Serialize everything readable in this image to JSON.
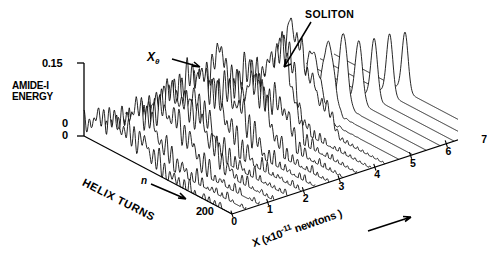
{
  "figure": {
    "type": "waterfall-3d-line-plot",
    "background": "#ffffff",
    "ink_color": "#000000"
  },
  "labels": {
    "y_axis_title_line1": "AMIDE-I",
    "y_axis_title_line2": "ENERGY",
    "y_max_tick": "0.15",
    "y_min_tick": "0",
    "origin_tick": "0",
    "depth_axis_title": "HELIX TURNS",
    "depth_arrow_symbol": "n",
    "depth_max_tick": "200",
    "x_axis_title_prefix": "X (x10",
    "x_axis_title_exponent": "-11",
    "x_axis_title_suffix": " newtons )",
    "annotation_soliton": "SOLITON",
    "annotation_xtheta_base": "X",
    "annotation_xtheta_sub": "θ"
  },
  "chart_data": {
    "type": "line",
    "title": "",
    "xlabel": "X (x10^-11 newtons)",
    "ylabel": "AMIDE-I ENERGY",
    "zlabel": "HELIX TURNS",
    "xlim": [
      0,
      7
    ],
    "ylim": [
      0,
      0.15
    ],
    "zlim": [
      0,
      200
    ],
    "grid": false,
    "legend": null,
    "x_ticks": [
      "0",
      "1",
      "2",
      "3",
      "4",
      "5",
      "6",
      "7"
    ],
    "x_tick_values": [
      0,
      1,
      2,
      3,
      4,
      5,
      6,
      7
    ],
    "y_ticks": [
      "0",
      "0.15"
    ],
    "y_tick_values": [
      0,
      0.15
    ],
    "z_ticks": [
      "0",
      "200"
    ],
    "z_tick_values": [
      0,
      200
    ],
    "n_traces": 19,
    "trace_axis": "X (force)",
    "series": [
      {
        "name": "X=0.00",
        "x_value": 0.0,
        "peak_height": 0.03,
        "peak_pos": 0.3,
        "peak_width": 0.26,
        "noise": 0.055,
        "ripple": 0.02,
        "sharp": false
      },
      {
        "name": "X=0.39",
        "x_value": 0.39,
        "peak_height": 0.034,
        "peak_pos": 0.31,
        "peak_width": 0.25,
        "noise": 0.055,
        "ripple": 0.021,
        "sharp": false
      },
      {
        "name": "X=0.78",
        "x_value": 0.78,
        "peak_height": 0.038,
        "peak_pos": 0.32,
        "peak_width": 0.24,
        "noise": 0.056,
        "ripple": 0.022,
        "sharp": false
      },
      {
        "name": "X=1.17",
        "x_value": 1.17,
        "peak_height": 0.043,
        "peak_pos": 0.33,
        "peak_width": 0.23,
        "noise": 0.057,
        "ripple": 0.023,
        "sharp": false
      },
      {
        "name": "X=1.56",
        "x_value": 1.56,
        "peak_height": 0.048,
        "peak_pos": 0.34,
        "peak_width": 0.22,
        "noise": 0.058,
        "ripple": 0.024,
        "sharp": false
      },
      {
        "name": "X=1.95",
        "x_value": 1.95,
        "peak_height": 0.054,
        "peak_pos": 0.35,
        "peak_width": 0.21,
        "noise": 0.058,
        "ripple": 0.025,
        "sharp": false
      },
      {
        "name": "X=2.33",
        "x_value": 2.33,
        "peak_height": 0.061,
        "peak_pos": 0.36,
        "peak_width": 0.195,
        "noise": 0.057,
        "ripple": 0.026,
        "sharp": false
      },
      {
        "name": "X=2.72",
        "x_value": 2.72,
        "peak_height": 0.069,
        "peak_pos": 0.37,
        "peak_width": 0.18,
        "noise": 0.055,
        "ripple": 0.026,
        "sharp": false
      },
      {
        "name": "X=3.11",
        "x_value": 3.11,
        "peak_height": 0.078,
        "peak_pos": 0.38,
        "peak_width": 0.16,
        "noise": 0.05,
        "ripple": 0.025,
        "sharp": false
      },
      {
        "name": "X=3.50",
        "x_value": 3.5,
        "peak_height": 0.088,
        "peak_pos": 0.39,
        "peak_width": 0.14,
        "noise": 0.044,
        "ripple": 0.023,
        "sharp": false
      },
      {
        "name": "X=3.89",
        "x_value": 3.89,
        "peak_height": 0.099,
        "peak_pos": 0.4,
        "peak_width": 0.118,
        "noise": 0.036,
        "ripple": 0.02,
        "sharp": false
      },
      {
        "name": "X=4.28",
        "x_value": 4.28,
        "peak_height": 0.112,
        "peak_pos": 0.41,
        "peak_width": 0.096,
        "noise": 0.027,
        "ripple": 0.016,
        "sharp": false
      },
      {
        "name": "X=4.67",
        "x_value": 4.67,
        "peak_height": 0.126,
        "peak_pos": 0.42,
        "peak_width": 0.074,
        "noise": 0.018,
        "ripple": 0.011,
        "sharp": true
      },
      {
        "name": "X=5.06",
        "x_value": 5.06,
        "peak_height": 0.141,
        "peak_pos": 0.43,
        "peak_width": 0.054,
        "noise": 0.009,
        "ripple": 0.006,
        "sharp": true
      },
      {
        "name": "X=5.44",
        "x_value": 5.44,
        "peak_height": 0.15,
        "peak_pos": 0.44,
        "peak_width": 0.04,
        "noise": 0.004,
        "ripple": 0.003,
        "sharp": true
      },
      {
        "name": "X=5.83",
        "x_value": 5.83,
        "peak_height": 0.128,
        "peak_pos": 0.45,
        "peak_width": 0.034,
        "noise": 0.002,
        "ripple": 0.001,
        "sharp": true
      },
      {
        "name": "X=6.22",
        "x_value": 6.22,
        "peak_height": 0.124,
        "peak_pos": 0.46,
        "peak_width": 0.031,
        "noise": 0.001,
        "ripple": 0.001,
        "sharp": true
      },
      {
        "name": "X=6.61",
        "x_value": 6.61,
        "peak_height": 0.126,
        "peak_pos": 0.47,
        "peak_width": 0.03,
        "noise": 0.001,
        "ripple": 0.0,
        "sharp": true
      },
      {
        "name": "X=7.00",
        "x_value": 7.0,
        "peak_height": 0.122,
        "peak_pos": 0.48,
        "peak_width": 0.029,
        "noise": 0.001,
        "ripple": 0.0,
        "sharp": true
      }
    ],
    "annotations": [
      {
        "text": "SOLITON",
        "points_to": "tall narrow peak on high-force traces"
      },
      {
        "text": "Xθ",
        "points_to": "back edge of the waterfall surface"
      }
    ]
  }
}
